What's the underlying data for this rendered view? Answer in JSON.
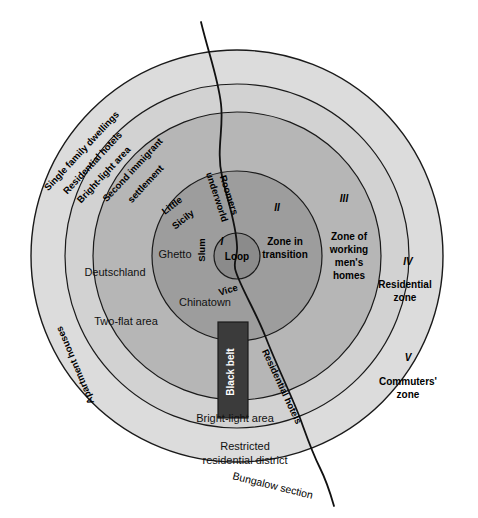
{
  "figure": {
    "name": "Burgess concentric zone model of Chicago",
    "background_color": "#ffffff"
  },
  "palette": {
    "zone1_loop": "#8e8e8e",
    "zone2": "#a3a3a3",
    "zone3": "#b9b9b9",
    "zone4": "#cfcfcf",
    "zone5_outer_ring": "#dcdcdc",
    "black_belt": "#3b3b3b",
    "outline": "#1a1a1a",
    "text": "#000000"
  },
  "zones": [
    {
      "numeral": "I",
      "title": "Loop",
      "title_line2": ""
    },
    {
      "numeral": "II",
      "title": "Zone in",
      "title_line2": "transition"
    },
    {
      "numeral": "III",
      "title": "Zone of",
      "title_line2": "working",
      "title_line3": "men's",
      "title_line4": "homes"
    },
    {
      "numeral": "IV",
      "title": "Residential",
      "title_line2": "zone"
    },
    {
      "numeral": "V",
      "title": "Commuters'",
      "title_line2": "zone"
    }
  ],
  "inner_labels": {
    "little": "Little",
    "sicily": "Sicily",
    "roomers": "Roomers",
    "underworld": "underworld",
    "slum": "Slum",
    "vice": "Vice",
    "ghetto": "Ghetto",
    "chinatown": "Chinatown",
    "deutschland": "Deutschland",
    "two_flat_area": "Two-flat area",
    "black_belt": "Black belt"
  },
  "outer_labels": {
    "single_family_dwellings": "Single family dwellings",
    "residential_hotels_upper": "Residential hotels",
    "bright_light_area_upper": "Bright-light area",
    "second_immigrant": "Second immigrant",
    "settlement": "settlement",
    "apartment_houses": "Apartment houses",
    "bright_light_area_lower": "Bright-light area",
    "restricted_line1": "Restricted",
    "restricted_line2": "residential district",
    "bungalow_section": "Bungalow section",
    "residential_hotels_lower": "Residential hotels"
  },
  "geometry": {
    "center_x": 237,
    "center_y": 256,
    "r_loop": 23,
    "r_zone2": 85,
    "r_zone3": 144,
    "r_zone4": 206
  }
}
